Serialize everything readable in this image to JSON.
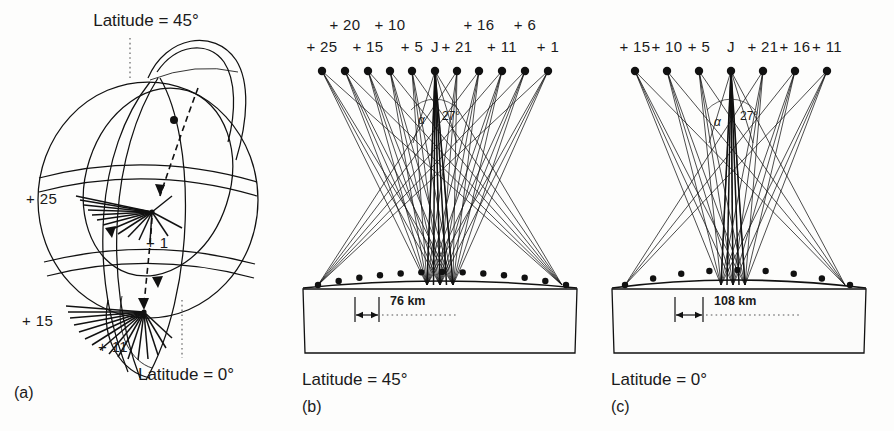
{
  "figure": {
    "caption_domain": "satellite-visibility-diagram"
  },
  "panel_a": {
    "letter": "(a)",
    "top_label": "Latitude = 45°",
    "bottom_label": "Latitude = 0°",
    "burst_labels": {
      "upper_left": "+ 25",
      "upper_right": "+ 1",
      "lower_left": "+ 15",
      "lower_right": "+ 11"
    },
    "upper_burst_spokes": 14,
    "lower_burst_spokes": 16
  },
  "panel_b": {
    "letter": "(b)",
    "caption": "Latitude = 45°",
    "scale_label": "76 km",
    "angle_alpha": "α",
    "angle_value": "27°",
    "satellite_count": 11,
    "labels_row_top": [
      "+ 20",
      "+ 10",
      "+ 16",
      "+ 6"
    ],
    "labels_row_bottom": [
      "+ 25",
      "+ 15",
      "+ 5",
      "J",
      "+ 21",
      "+ 11",
      "+ 1"
    ],
    "satellites": [
      {
        "id": "+ 25",
        "x": 322,
        "row": "bottom"
      },
      {
        "id": "+ 20",
        "x": 345,
        "row": "top"
      },
      {
        "id": "+ 15",
        "x": 368,
        "row": "bottom"
      },
      {
        "id": "+ 10",
        "x": 390,
        "row": "top"
      },
      {
        "id": "+ 5",
        "x": 412,
        "row": "bottom"
      },
      {
        "id": "J",
        "x": 435,
        "row": "bottom"
      },
      {
        "id": "+ 21",
        "x": 457,
        "row": "bottom"
      },
      {
        "id": "+ 16",
        "x": 479,
        "row": "top"
      },
      {
        "id": "+ 11",
        "x": 502,
        "row": "bottom"
      },
      {
        "id": "+ 6",
        "x": 525,
        "row": "top"
      },
      {
        "id": "+ 1",
        "x": 548,
        "row": "bottom"
      }
    ],
    "ground_marker_count": 13
  },
  "panel_c": {
    "letter": "(c)",
    "caption": "Latitude = 0°",
    "scale_label": "108 km",
    "angle_alpha": "α",
    "angle_value": "27°",
    "satellite_count": 7,
    "labels_row_bottom": [
      "+ 15",
      "+ 10",
      "+ 5",
      "J",
      "+ 21",
      "+ 16",
      "+ 11"
    ],
    "satellites": [
      {
        "id": "+ 15",
        "x": 635
      },
      {
        "id": "+ 10",
        "x": 667
      },
      {
        "id": "+ 5",
        "x": 699
      },
      {
        "id": "J",
        "x": 731
      },
      {
        "id": "+ 21",
        "x": 763
      },
      {
        "id": "+ 16",
        "x": 795
      },
      {
        "id": "+ 11",
        "x": 827
      }
    ],
    "ground_marker_count": 9
  }
}
